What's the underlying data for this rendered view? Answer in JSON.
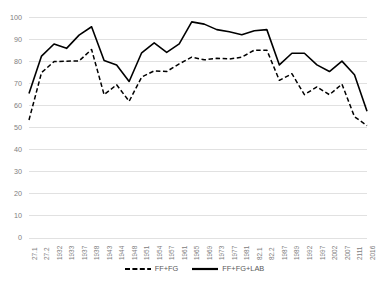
{
  "chart_data": {
    "type": "line",
    "title": "",
    "xlabel": "",
    "ylabel": "",
    "ylim": [
      0,
      100
    ],
    "ytick_step": 10,
    "yticks": [
      0,
      10,
      20,
      30,
      40,
      50,
      60,
      70,
      80,
      90,
      100
    ],
    "grid": true,
    "grid_axis": "y",
    "legend_position": "bottom",
    "categories": [
      "27.1",
      "27.2",
      "1932",
      "1933",
      "1937",
      "1938",
      "1943",
      "1944",
      "1948",
      "1951",
      "1954",
      "1957",
      "1961",
      "1965",
      "1969",
      "1973",
      "1977",
      "1981",
      "82.1",
      "82.2",
      "1987",
      "1989",
      "1992",
      "1997",
      "2002",
      "2007",
      "2111",
      "2016"
    ],
    "series": [
      {
        "name": "FF+FG",
        "style": "dashed",
        "color": "#000000",
        "values": [
          53.5,
          75.0,
          80.0,
          80.2,
          80.3,
          85.5,
          65.0,
          69.5,
          62.0,
          73.0,
          75.8,
          75.5,
          79.0,
          82.0,
          80.8,
          81.5,
          81.2,
          82.0,
          85.2,
          85.2,
          71.5,
          74.5,
          65.0,
          68.5,
          65.0,
          69.8,
          55.0,
          51.0
        ]
      },
      {
        "name": "FF+FG+LAB",
        "style": "solid",
        "color": "#000000",
        "values": [
          65.5,
          82.5,
          88.0,
          86.0,
          92.0,
          95.8,
          80.5,
          78.5,
          71.0,
          84.0,
          88.5,
          84.2,
          88.0,
          98.0,
          97.0,
          94.5,
          93.5,
          92.2,
          94.0,
          94.5,
          78.5,
          83.8,
          83.8,
          78.5,
          75.5,
          80.2,
          74.0,
          57.5
        ]
      }
    ]
  },
  "legend": {
    "items": [
      {
        "label": "FF+FG",
        "style": "dashed"
      },
      {
        "label": "FF+FG+LAB",
        "style": "solid"
      }
    ]
  },
  "colors": {
    "line": "#000000",
    "gridline": "#d9d9d9",
    "tick_text": "#808080",
    "legend_text": "#595959",
    "background": "#ffffff"
  }
}
